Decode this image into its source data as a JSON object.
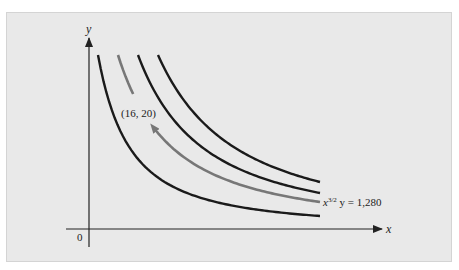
{
  "chart_data": {
    "type": "line",
    "title": "",
    "xlabel": "x",
    "ylabel": "y",
    "origin_label": "0",
    "grid": false,
    "series": [
      {
        "name": "level-curve-1",
        "k_rel": 0.75,
        "color": "#1a1a1a"
      },
      {
        "name": "x^{3/2} y = 1,280",
        "k_rel": 1.0,
        "color": "#777777",
        "highlighted": true,
        "direction_arrow": true
      },
      {
        "name": "level-curve-3",
        "k_rel": 1.3,
        "color": "#1a1a1a"
      },
      {
        "name": "level-curve-4",
        "k_rel": 1.7,
        "color": "#1a1a1a"
      }
    ],
    "annotations": [
      {
        "text": "(16, 20)",
        "point": [
          16,
          20
        ],
        "target": "highlighted-curve"
      },
      {
        "text": "x3/2 y = 1,280",
        "base": "x",
        "sup": "3/2",
        "rest": " y = 1,280"
      }
    ],
    "colors": {
      "panel": "#e9e9e9",
      "axis": "#222222",
      "highlight": "#777777",
      "curve": "#1a1a1a"
    }
  }
}
